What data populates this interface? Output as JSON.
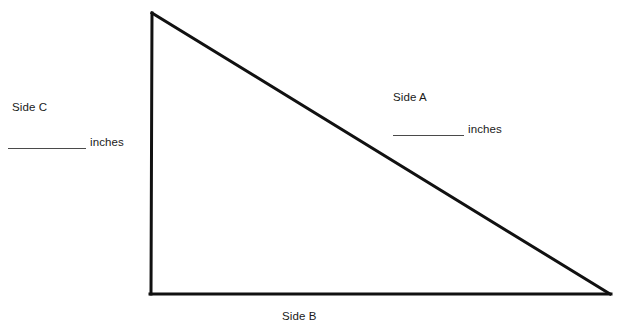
{
  "figure": {
    "type": "right-triangle-worksheet",
    "background_color": "#ffffff",
    "stroke_color": "#111111",
    "stroke_width": 3,
    "vertices": {
      "apex": [
        152,
        12
      ],
      "bottom_left": [
        150,
        295
      ],
      "bottom_right": [
        611,
        295
      ]
    }
  },
  "labels": {
    "side_a": "Side A",
    "side_b": "Side B",
    "side_c": "Side C"
  },
  "blanks": {
    "side_a": {
      "value": "",
      "unit": "inches"
    },
    "side_c": {
      "value": "",
      "unit": "inches"
    }
  }
}
